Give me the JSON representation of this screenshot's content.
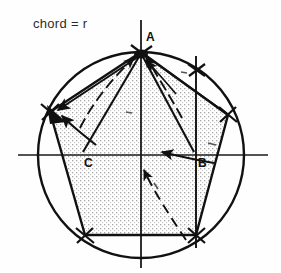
{
  "figure": {
    "title_note": "chord = r",
    "kind": "geometric-construction",
    "colors": {
      "ink": "#111111",
      "stipple": "#b9b9b9",
      "background": "#fefefe",
      "axis": "#1a1a1a"
    },
    "canvas": {
      "width": 281,
      "height": 273
    },
    "circle": {
      "cx": 141,
      "cy": 155,
      "r": 103
    },
    "axes": {
      "horizontal": {
        "x1": 18,
        "y1": 155,
        "x2": 268,
        "y2": 155
      },
      "vertical": {
        "x1": 141,
        "y1": 20,
        "x2": 141,
        "y2": 268
      }
    },
    "points": [
      {
        "name": "A",
        "label": "A",
        "x": 141,
        "y": 52,
        "label_x": 146,
        "label_y": 30
      },
      {
        "name": "B",
        "label": "B",
        "x": 196,
        "y": 155,
        "label_x": 198,
        "label_y": 156
      },
      {
        "name": "C",
        "label": "C",
        "x": 82,
        "y": 155,
        "label_x": 84,
        "label_y": 156
      }
    ],
    "pentagon_vertices": [
      {
        "x": 141,
        "y": 52
      },
      {
        "x": 228,
        "y": 115
      },
      {
        "x": 196,
        "y": 235
      },
      {
        "x": 85,
        "y": 235
      },
      {
        "x": 50,
        "y": 112
      }
    ],
    "vertical_chord_x": 196,
    "construction_arcs": 6,
    "arrow_count": 7
  }
}
